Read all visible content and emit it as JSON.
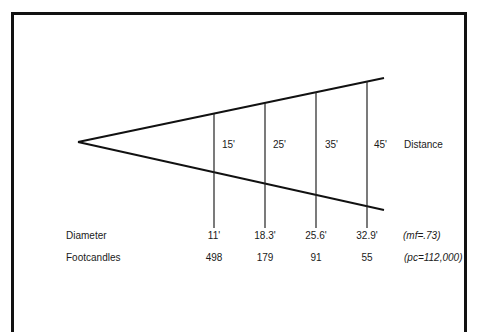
{
  "diagram": {
    "distance_label": "Distance",
    "distances": [
      "15'",
      "25'",
      "35'",
      "45'"
    ],
    "rows": [
      {
        "label": "Diameter",
        "values": [
          "11'",
          "18.3'",
          "25.6'",
          "32.9'"
        ],
        "note": "(mf=.73)"
      },
      {
        "label": "Footcandles",
        "values": [
          "498",
          "179",
          "91",
          "55"
        ],
        "note": "(pc=112,000)"
      }
    ],
    "line_color": "#111111"
  }
}
